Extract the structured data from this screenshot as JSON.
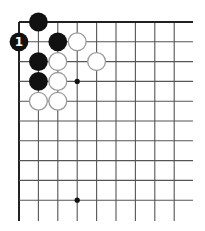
{
  "diagram": {
    "type": "go-board-corner",
    "grid": {
      "origin_x": 19,
      "origin_y": 22,
      "spacing_x": 19.4,
      "spacing_y": 19.8,
      "columns": 9,
      "rows": 10,
      "right_extent": 193,
      "bottom_extent": 221,
      "line_color": "#555555",
      "edge_color": "#222222"
    },
    "star_points": [
      {
        "col": 3,
        "row": 3
      },
      {
        "col": 3,
        "row": 9
      }
    ],
    "stones": [
      {
        "color": "black",
        "col": 1,
        "row": 0,
        "label": ""
      },
      {
        "color": "black",
        "col": 0,
        "row": 1,
        "label": "1"
      },
      {
        "color": "black",
        "col": 2,
        "row": 1,
        "label": ""
      },
      {
        "color": "white",
        "col": 3,
        "row": 1,
        "label": ""
      },
      {
        "color": "black",
        "col": 1,
        "row": 2,
        "label": ""
      },
      {
        "color": "white",
        "col": 2,
        "row": 2,
        "label": ""
      },
      {
        "color": "white",
        "col": 4,
        "row": 2,
        "label": ""
      },
      {
        "color": "black",
        "col": 1,
        "row": 3,
        "label": ""
      },
      {
        "color": "white",
        "col": 2,
        "row": 3,
        "label": ""
      },
      {
        "color": "white",
        "col": 1,
        "row": 4,
        "label": ""
      },
      {
        "color": "white",
        "col": 2,
        "row": 4,
        "label": ""
      }
    ],
    "colors": {
      "black_stone": "#111111",
      "white_stone": "#ffffff",
      "white_stone_border": "#9a9a9a",
      "label_on_black": "#ffffff"
    }
  }
}
